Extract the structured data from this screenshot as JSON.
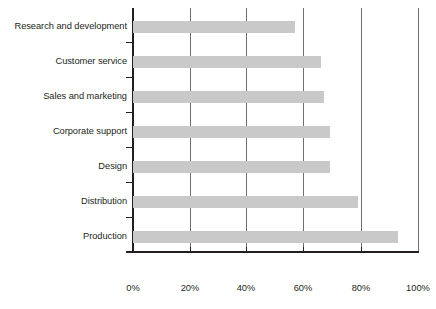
{
  "chart_data": {
    "type": "bar",
    "orientation": "horizontal",
    "title": "",
    "subtitle": "",
    "xlabel": "",
    "ylabel": "",
    "categories": [
      "Research and development",
      "Customer service",
      "Sales and marketing",
      "Corporate support",
      "Design",
      "Distribution",
      "Production"
    ],
    "values": [
      57,
      66,
      67,
      69,
      69,
      79,
      93
    ],
    "value_suffix": "%",
    "xlim": [
      0,
      100
    ],
    "xticks": [
      0,
      20,
      40,
      60,
      80,
      100
    ],
    "xtick_labels": [
      "0%",
      "20%",
      "40%",
      "60%",
      "80%",
      "100%"
    ],
    "grid": "vertical",
    "legend": "none",
    "series": [
      {
        "name": "",
        "values": [
          57,
          66,
          67,
          69,
          69,
          79,
          93
        ],
        "color": "#c9c9c9"
      }
    ],
    "colors": {
      "bar": "#c9c9c9",
      "axis": "#231f20",
      "gridline": "#6f6f6f",
      "text": "#231f20",
      "background": "#ffffff"
    }
  }
}
